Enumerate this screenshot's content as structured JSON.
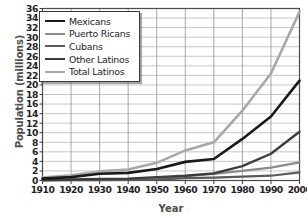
{
  "chart_data": {
    "type": "line",
    "title": "",
    "xlabel": "Year",
    "ylabel": "Population (millions)",
    "x": [
      1910,
      1920,
      1930,
      1940,
      1950,
      1960,
      1970,
      1980,
      1990,
      2000
    ],
    "xlim": [
      1910,
      2000
    ],
    "ylim": [
      0,
      36
    ],
    "ytick_step": 2,
    "xtick_step": 10,
    "grid": true,
    "legend_position": "top-left",
    "xticks": [
      "1910",
      "1920",
      "1930",
      "1940",
      "1950",
      "1960",
      "1970",
      "1980",
      "1990",
      "2000"
    ],
    "yticks": [
      "0",
      "2",
      "4",
      "6",
      "8",
      "10",
      "12",
      "14",
      "16",
      "18",
      "20",
      "22",
      "24",
      "26",
      "28",
      "30",
      "32",
      "34",
      "36"
    ],
    "series": [
      {
        "name": "Mexicans",
        "color": "#1a1a1a",
        "width": 2.6,
        "values": [
          0.4,
          0.7,
          1.4,
          1.6,
          2.4,
          3.9,
          4.5,
          8.7,
          13.4,
          20.9
        ]
      },
      {
        "name": "Puerto Ricans",
        "color": "#8c8c8c",
        "width": 2.2,
        "values": [
          0.05,
          0.1,
          0.15,
          0.2,
          0.4,
          0.9,
          1.4,
          2.0,
          2.7,
          3.8
        ]
      },
      {
        "name": "Cubans",
        "color": "#5a5a5a",
        "width": 2.2,
        "values": [
          0.03,
          0.05,
          0.08,
          0.1,
          0.2,
          0.5,
          0.6,
          0.8,
          1.0,
          1.7
        ]
      },
      {
        "name": "Other Latinos",
        "color": "#3d3d3d",
        "width": 2.4,
        "values": [
          0.1,
          0.2,
          0.3,
          0.4,
          0.7,
          1.0,
          1.5,
          3.0,
          5.6,
          10.2
        ]
      },
      {
        "name": "Total Latinos",
        "color": "#a8a8a8",
        "width": 2.6,
        "values": [
          0.6,
          1.1,
          1.9,
          2.3,
          3.7,
          6.3,
          8.0,
          14.6,
          22.4,
          35.3
        ]
      }
    ]
  },
  "legend": {
    "items": [
      {
        "label": "Mexicans"
      },
      {
        "label": "Puerto Ricans"
      },
      {
        "label": "Cubans"
      },
      {
        "label": "Other Latinos"
      },
      {
        "label": "Total Latinos"
      }
    ]
  }
}
